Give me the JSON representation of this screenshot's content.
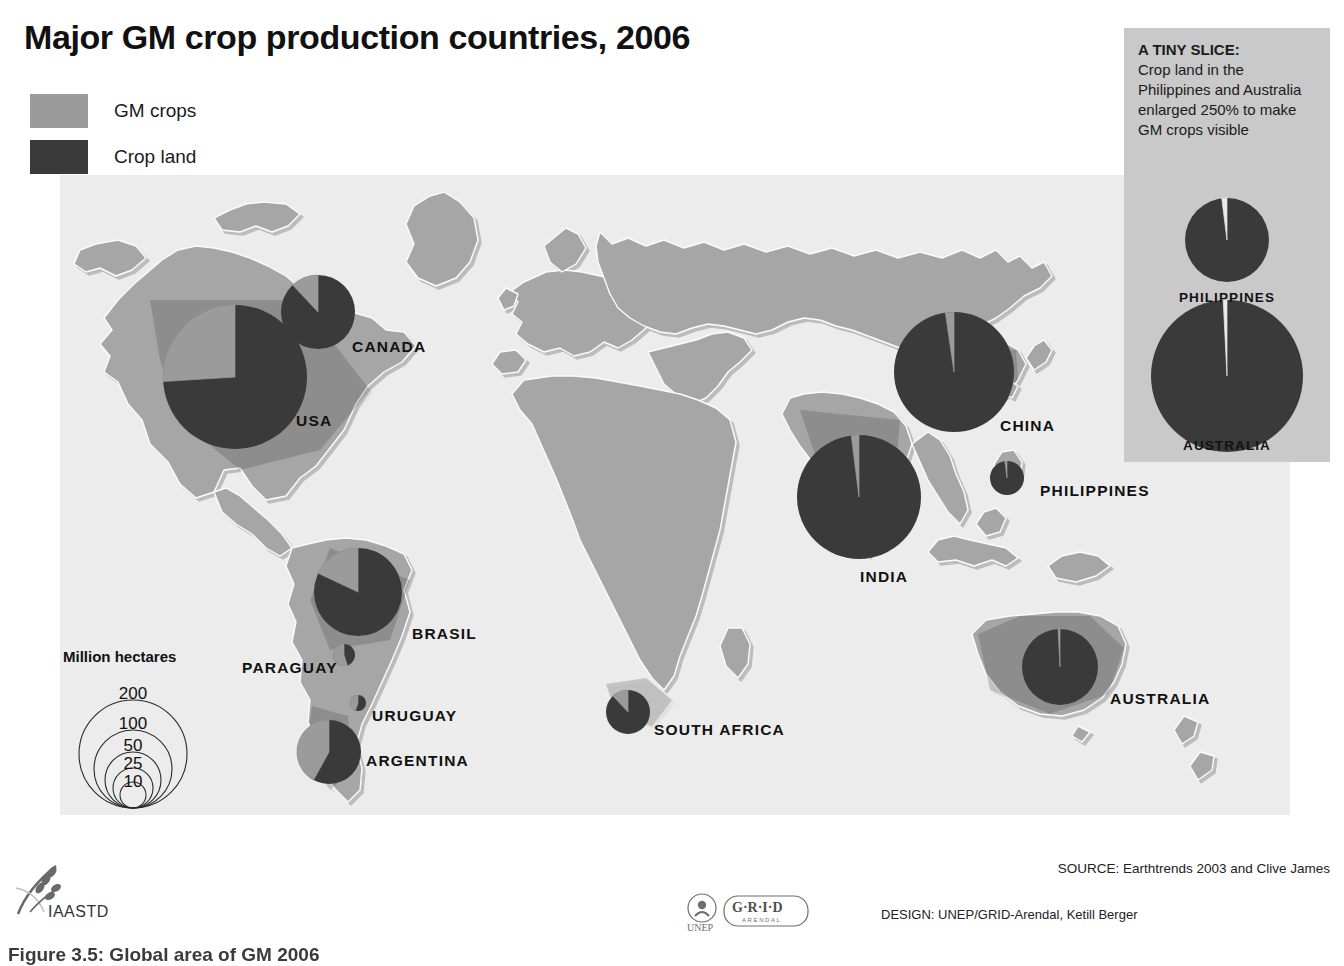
{
  "title": "Major GM crop production countries, 2006",
  "legend": {
    "items": [
      {
        "label": "GM crops",
        "color": "#9b9b9b"
      },
      {
        "label": "Crop land",
        "color": "#3a3a3a"
      }
    ]
  },
  "size_legend": {
    "title": "Million hectares",
    "unit": "Million hectares",
    "values": [
      "200",
      "100",
      "50",
      "25",
      "10"
    ]
  },
  "inset": {
    "heading": "A TINY SLICE:",
    "body": "Crop land in the Philippines and Australia enlarged 250% to make GM crops visible",
    "background": "#c9c9c9",
    "charts": [
      {
        "label": "PHILIPPINES",
        "gm_percent": 2.0
      },
      {
        "label": "AUSTRALIA",
        "gm_percent": 0.8
      }
    ]
  },
  "footer": {
    "source": "SOURCE: Earthtrends 2003 and Clive James",
    "design": "DESIGN: UNEP/GRID-Arendal, Ketill Berger",
    "unep_logo_text": "UNEP",
    "grid_logo_text": "G·R·I·D",
    "grid_logo_sub": "ARENDAL",
    "iaastd_logo_text": "IAASTD",
    "clipped_caption": "Figure 3.5: Global area of GM 2006"
  },
  "chart_data": {
    "type": "pie",
    "title": "Major GM crop production countries, 2006",
    "unit": "Million hectares",
    "series_names": [
      "GM crops",
      "Crop land"
    ],
    "colors": {
      "gm": "#9b9b9b",
      "crop": "#3a3a3a",
      "land": "#a6a6a6",
      "ocean": "#ebebeb"
    },
    "note": "Each pie is sized by total crop land area; the light wedge is the GM crop share.",
    "countries": [
      {
        "name": "USA",
        "crop_land_mha": 175,
        "gm_percent": 26.0,
        "radius_px": 72,
        "cx": 235,
        "cy": 377,
        "label_x": 296,
        "label_y": 412
      },
      {
        "name": "CANADA",
        "crop_land_mha": 46,
        "gm_percent": 12.0,
        "radius_px": 37,
        "cx": 318,
        "cy": 312,
        "label_x": 352,
        "label_y": 338
      },
      {
        "name": "BRASIL",
        "crop_land_mha": 66,
        "gm_percent": 18.0,
        "radius_px": 44,
        "cx": 358,
        "cy": 592,
        "label_x": 412,
        "label_y": 625
      },
      {
        "name": "ARGENTINA",
        "crop_land_mha": 35,
        "gm_percent": 42.0,
        "radius_px": 32,
        "cx": 329,
        "cy": 752,
        "label_x": 366,
        "label_y": 752
      },
      {
        "name": "PARAGUAY",
        "crop_land_mha": 4,
        "gm_percent": 55.0,
        "radius_px": 11,
        "cx": 344,
        "cy": 655,
        "label_x": 242,
        "label_y": 659
      },
      {
        "name": "URUGUAY",
        "crop_land_mha": 1.6,
        "gm_percent": 45.0,
        "radius_px": 8,
        "cx": 358,
        "cy": 703,
        "label_x": 372,
        "label_y": 707
      },
      {
        "name": "CHINA",
        "crop_land_mha": 155,
        "gm_percent": 2.3,
        "radius_px": 60,
        "cx": 954,
        "cy": 372,
        "label_x": 1000,
        "label_y": 417
      },
      {
        "name": "INDIA",
        "crop_land_mha": 170,
        "gm_percent": 2.0,
        "radius_px": 62,
        "cx": 859,
        "cy": 497,
        "label_x": 860,
        "label_y": 568
      },
      {
        "name": "PHILIPPINES",
        "crop_land_mha": 11,
        "gm_percent": 2.0,
        "radius_px": 17,
        "cx": 1007,
        "cy": 478,
        "label_x": 1040,
        "label_y": 482
      },
      {
        "name": "AUSTRALIA",
        "crop_land_mha": 48,
        "gm_percent": 0.8,
        "radius_px": 38,
        "cx": 1060,
        "cy": 667,
        "label_x": 1110,
        "label_y": 690
      },
      {
        "name": "SOUTH AFRICA",
        "crop_land_mha": 15,
        "gm_percent": 12.0,
        "radius_px": 22,
        "cx": 628,
        "cy": 712,
        "label_x": 654,
        "label_y": 721
      }
    ]
  }
}
